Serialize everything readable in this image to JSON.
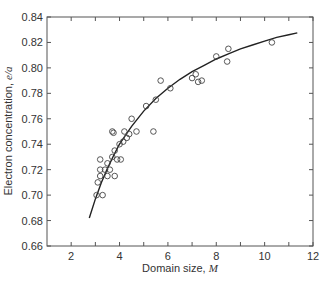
{
  "chart_data": {
    "type": "scatter",
    "title": "",
    "xlabel": "Domain size, M",
    "xlabel_text": "Domain size, ",
    "xlabel_var": "M",
    "ylabel": "Electron concentration, e/a",
    "ylabel_text": "Electron concentration, ",
    "ylabel_var": "e/a",
    "xlim": [
      1,
      12
    ],
    "ylim": [
      0.66,
      0.84
    ],
    "x_ticks": [
      2,
      4,
      6,
      8,
      10,
      12
    ],
    "x_minor_ticks": [
      3,
      5,
      7,
      9,
      11
    ],
    "y_ticks": [
      0.66,
      0.68,
      0.7,
      0.72,
      0.74,
      0.76,
      0.78,
      0.8,
      0.82,
      0.84
    ],
    "y_tick_labels": [
      "0.66",
      "0.68",
      "0.70",
      "0.72",
      "0.74",
      "0.76",
      "0.78",
      "0.80",
      "0.82",
      "0.84"
    ],
    "grid": false,
    "legend": null,
    "series": [
      {
        "name": "measured",
        "marker": "open-circle",
        "points": [
          [
            3.05,
            0.7
          ],
          [
            3.3,
            0.7
          ],
          [
            3.1,
            0.71
          ],
          [
            3.2,
            0.715
          ],
          [
            3.5,
            0.715
          ],
          [
            3.8,
            0.715
          ],
          [
            3.2,
            0.72
          ],
          [
            3.4,
            0.72
          ],
          [
            3.6,
            0.72
          ],
          [
            3.2,
            0.728
          ],
          [
            3.5,
            0.725
          ],
          [
            3.9,
            0.728
          ],
          [
            4.05,
            0.728
          ],
          [
            3.7,
            0.73
          ],
          [
            3.8,
            0.735
          ],
          [
            4.0,
            0.74
          ],
          [
            4.15,
            0.742
          ],
          [
            4.3,
            0.745
          ],
          [
            4.4,
            0.748
          ],
          [
            3.7,
            0.75
          ],
          [
            3.75,
            0.749
          ],
          [
            4.2,
            0.75
          ],
          [
            4.7,
            0.75
          ],
          [
            5.4,
            0.75
          ],
          [
            4.5,
            0.76
          ],
          [
            5.1,
            0.77
          ],
          [
            5.5,
            0.775
          ],
          [
            5.7,
            0.79
          ],
          [
            6.1,
            0.784
          ],
          [
            7.0,
            0.792
          ],
          [
            7.15,
            0.795
          ],
          [
            7.25,
            0.789
          ],
          [
            7.4,
            0.79
          ],
          [
            8.0,
            0.809
          ],
          [
            8.45,
            0.805
          ],
          [
            8.5,
            0.815
          ],
          [
            10.3,
            0.82
          ]
        ]
      },
      {
        "name": "fit curve",
        "type": "line",
        "points": [
          [
            2.75,
            0.682
          ],
          [
            3.0,
            0.697
          ],
          [
            3.25,
            0.71
          ],
          [
            3.5,
            0.721
          ],
          [
            3.75,
            0.731
          ],
          [
            4.0,
            0.74
          ],
          [
            4.5,
            0.754
          ],
          [
            5.0,
            0.766
          ],
          [
            5.5,
            0.776
          ],
          [
            6.0,
            0.784
          ],
          [
            6.5,
            0.791
          ],
          [
            7.0,
            0.797
          ],
          [
            7.5,
            0.802
          ],
          [
            8.0,
            0.807
          ],
          [
            8.5,
            0.811
          ],
          [
            9.0,
            0.815
          ],
          [
            9.5,
            0.818
          ],
          [
            10.0,
            0.821
          ],
          [
            10.5,
            0.824
          ],
          [
            11.0,
            0.826
          ],
          [
            11.35,
            0.8275
          ]
        ]
      }
    ],
    "colors": {
      "axis": "#555555",
      "marker": "#444444",
      "curve": "#222222",
      "text": "#333333"
    }
  }
}
